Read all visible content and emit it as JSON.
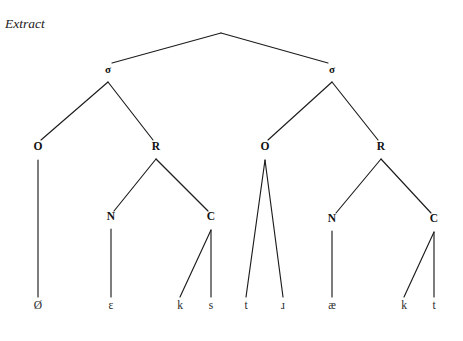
{
  "figure": {
    "caption": "Extract",
    "type": "syllable-structure-tree",
    "background_color": "#ffffff",
    "line_color": "#1c1c1c",
    "text_color": "#111111"
  },
  "tree": {
    "nodes": [
      {
        "id": "root",
        "label": "",
        "x": 221,
        "y": 33,
        "kind": "apex",
        "visible_label": false
      },
      {
        "id": "sigma1",
        "label": "σ",
        "x": 108,
        "y": 73,
        "kind": "syllable",
        "visible_label": true
      },
      {
        "id": "sigma2",
        "label": "σ",
        "x": 332,
        "y": 73,
        "kind": "syllable",
        "visible_label": true
      },
      {
        "id": "onset1",
        "label": "O",
        "x": 38,
        "y": 150,
        "kind": "onset",
        "visible_label": true
      },
      {
        "id": "rhyme1",
        "label": "R",
        "x": 156,
        "y": 150,
        "kind": "rhyme",
        "visible_label": true
      },
      {
        "id": "onset2",
        "label": "O",
        "x": 265,
        "y": 150,
        "kind": "onset",
        "visible_label": true
      },
      {
        "id": "rhyme2",
        "label": "R",
        "x": 381,
        "y": 150,
        "kind": "rhyme",
        "visible_label": true
      },
      {
        "id": "nucleus1",
        "label": "N",
        "x": 111,
        "y": 220,
        "kind": "nucleus",
        "visible_label": true
      },
      {
        "id": "coda1",
        "label": "C",
        "x": 211,
        "y": 220,
        "kind": "coda",
        "visible_label": true
      },
      {
        "id": "nucleus2",
        "label": "N",
        "x": 332,
        "y": 222,
        "kind": "nucleus",
        "visible_label": true
      },
      {
        "id": "coda2",
        "label": "C",
        "x": 434,
        "y": 222,
        "kind": "coda",
        "visible_label": true
      }
    ],
    "terminals": [
      {
        "id": "t1",
        "label": "Ø",
        "x": 38,
        "y": 309,
        "parent": "onset1",
        "name": "null-onset"
      },
      {
        "id": "t2",
        "label": "ɛ",
        "x": 111,
        "y": 309,
        "parent": "nucleus1",
        "name": "open-e"
      },
      {
        "id": "t3",
        "label": "k",
        "x": 180,
        "y": 309,
        "parent": "coda1",
        "name": "k"
      },
      {
        "id": "t4",
        "label": "s",
        "x": 211,
        "y": 309,
        "parent": "coda1",
        "name": "s"
      },
      {
        "id": "t5",
        "label": "t",
        "x": 246,
        "y": 309,
        "parent": "onset2",
        "name": "t"
      },
      {
        "id": "t6",
        "label": "ɹ",
        "x": 283,
        "y": 309,
        "parent": "onset2",
        "name": "turned-r"
      },
      {
        "id": "t7",
        "label": "æ",
        "x": 332,
        "y": 309,
        "parent": "nucleus2",
        "name": "ash"
      },
      {
        "id": "t8",
        "label": "k",
        "x": 404,
        "y": 309,
        "parent": "coda2",
        "name": "k"
      },
      {
        "id": "t9",
        "label": "t",
        "x": 434,
        "y": 309,
        "parent": "coda2",
        "name": "t"
      }
    ],
    "edges": [
      {
        "from": "root",
        "to": "sigma1",
        "x1": 221,
        "y1": 33,
        "x2": 112,
        "y2": 63
      },
      {
        "from": "root",
        "to": "sigma2",
        "x1": 221,
        "y1": 33,
        "x2": 328,
        "y2": 63
      },
      {
        "from": "sigma1",
        "to": "onset1",
        "x1": 108,
        "y1": 82,
        "x2": 41,
        "y2": 140
      },
      {
        "from": "sigma1",
        "to": "rhyme1",
        "x1": 108,
        "y1": 82,
        "x2": 153,
        "y2": 140
      },
      {
        "from": "sigma2",
        "to": "onset2",
        "x1": 332,
        "y1": 82,
        "x2": 268,
        "y2": 140
      },
      {
        "from": "sigma2",
        "to": "rhyme2",
        "x1": 332,
        "y1": 82,
        "x2": 378,
        "y2": 140
      },
      {
        "from": "onset1",
        "to": "t1",
        "x1": 38,
        "y1": 160,
        "x2": 38,
        "y2": 297
      },
      {
        "from": "rhyme1",
        "to": "nucleus1",
        "x1": 156,
        "y1": 159,
        "x2": 114,
        "y2": 211
      },
      {
        "from": "rhyme1",
        "to": "coda1",
        "x1": 156,
        "y1": 159,
        "x2": 208,
        "y2": 211
      },
      {
        "from": "nucleus1",
        "to": "t2",
        "x1": 111,
        "y1": 229,
        "x2": 111,
        "y2": 297
      },
      {
        "from": "coda1",
        "to": "t3",
        "x1": 211,
        "y1": 230,
        "x2": 180,
        "y2": 297
      },
      {
        "from": "coda1",
        "to": "t4",
        "x1": 211,
        "y1": 230,
        "x2": 211,
        "y2": 297
      },
      {
        "from": "onset2",
        "to": "t5",
        "x1": 265,
        "y1": 160,
        "x2": 246,
        "y2": 297
      },
      {
        "from": "onset2",
        "to": "t6",
        "x1": 265,
        "y1": 160,
        "x2": 283,
        "y2": 297
      },
      {
        "from": "rhyme2",
        "to": "nucleus2",
        "x1": 381,
        "y1": 159,
        "x2": 336,
        "y2": 213
      },
      {
        "from": "rhyme2",
        "to": "coda2",
        "x1": 381,
        "y1": 159,
        "x2": 431,
        "y2": 213
      },
      {
        "from": "nucleus2",
        "to": "t7",
        "x1": 332,
        "y1": 231,
        "x2": 332,
        "y2": 297
      },
      {
        "from": "coda2",
        "to": "t8",
        "x1": 434,
        "y1": 232,
        "x2": 404,
        "y2": 297
      },
      {
        "from": "coda2",
        "to": "t9",
        "x1": 434,
        "y1": 232,
        "x2": 434,
        "y2": 297
      }
    ]
  }
}
